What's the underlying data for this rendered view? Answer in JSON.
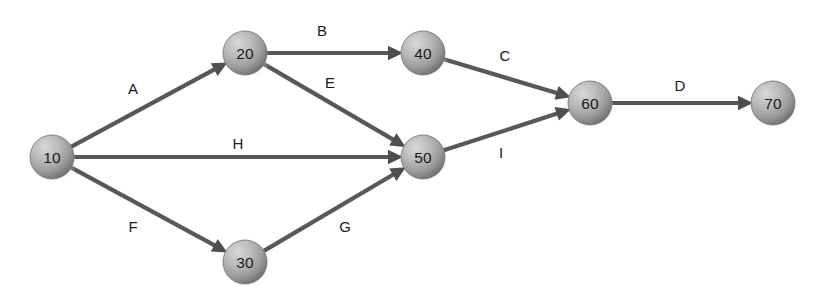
{
  "diagram": {
    "type": "activity-on-arrow-network",
    "title": "",
    "canvas": {
      "width": 820,
      "height": 305,
      "background": "#ffffff"
    },
    "style": {
      "node_fill_light": "#cfcfcf",
      "node_fill_mid": "#a9a9a9",
      "node_fill_dark": "#6e6e6e",
      "node_stroke": "#7a7a7a",
      "edge_color": "#585858",
      "arrow_color": "#4e4e4e",
      "label_color": "#1a1a1a",
      "shadow_color": "#bdbdbd",
      "node_radius": 22,
      "edge_width": 4.2
    },
    "nodes": [
      {
        "id": "n10",
        "label": "10",
        "cx": 52,
        "cy": 157
      },
      {
        "id": "n20",
        "label": "20",
        "cx": 245,
        "cy": 53
      },
      {
        "id": "n30",
        "label": "30",
        "cx": 245,
        "cy": 262
      },
      {
        "id": "n40",
        "label": "40",
        "cx": 423,
        "cy": 53
      },
      {
        "id": "n50",
        "label": "50",
        "cx": 423,
        "cy": 157
      },
      {
        "id": "n60",
        "label": "60",
        "cx": 590,
        "cy": 103
      },
      {
        "id": "n70",
        "label": "70",
        "cx": 773,
        "cy": 103
      }
    ],
    "edges": [
      {
        "id": "eA",
        "label": "A",
        "from": "n10",
        "to": "n20",
        "label_x": 133,
        "label_y": 88
      },
      {
        "id": "eB",
        "label": "B",
        "from": "n20",
        "to": "n40",
        "label_x": 322,
        "label_y": 30
      },
      {
        "id": "eE",
        "label": "E",
        "from": "n20",
        "to": "n50",
        "label_x": 330,
        "label_y": 82
      },
      {
        "id": "eH",
        "label": "H",
        "from": "n10",
        "to": "n50",
        "label_x": 238,
        "label_y": 143
      },
      {
        "id": "eF",
        "label": "F",
        "from": "n10",
        "to": "n30",
        "label_x": 133,
        "label_y": 226
      },
      {
        "id": "eG",
        "label": "G",
        "from": "n30",
        "to": "n50",
        "label_x": 345,
        "label_y": 226
      },
      {
        "id": "eC",
        "label": "C",
        "from": "n40",
        "to": "n60",
        "label_x": 505,
        "label_y": 55
      },
      {
        "id": "eI",
        "label": "I",
        "from": "n50",
        "to": "n60",
        "label_x": 501,
        "label_y": 152
      },
      {
        "id": "eD",
        "label": "D",
        "from": "n60",
        "to": "n70",
        "label_x": 680,
        "label_y": 85
      }
    ]
  }
}
